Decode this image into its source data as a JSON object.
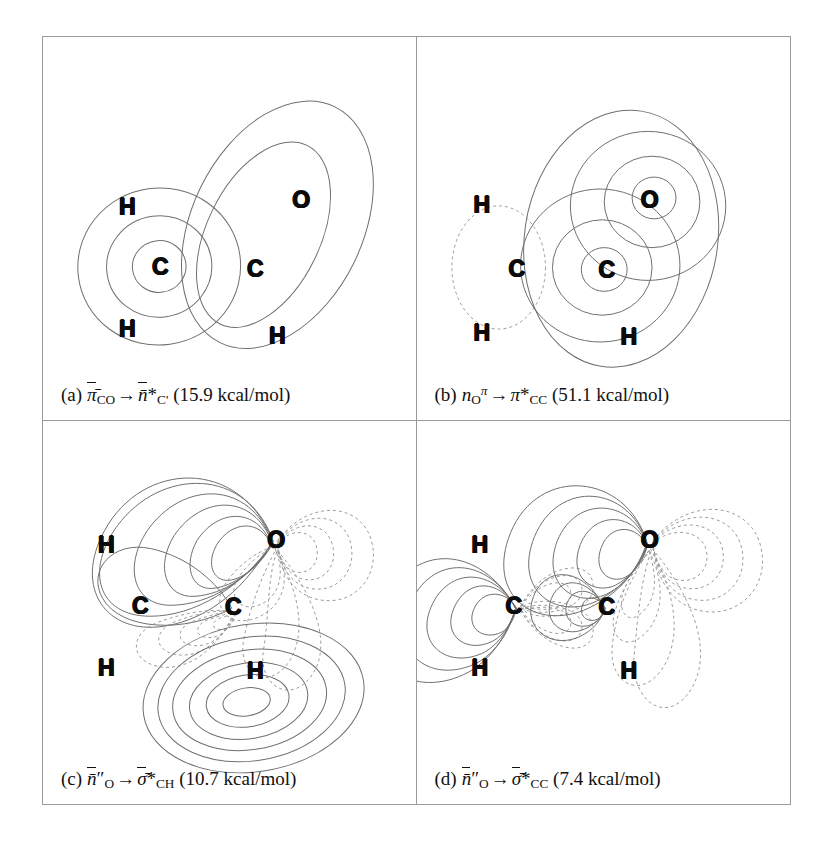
{
  "figure": {
    "kind": "molecular-orbital-contour-panels",
    "panel_count": 4,
    "molecule_atoms": [
      "H",
      "C",
      "H",
      "C",
      "O",
      "H"
    ]
  },
  "panels": [
    {
      "id": "a",
      "label": "(a)",
      "donor": {
        "symbol": "π",
        "overbar": true,
        "sub": "CO",
        "sup": "",
        "star": false
      },
      "acceptor": {
        "symbol": "n",
        "overbar": true,
        "sub": "C'",
        "sup": "",
        "star": true
      },
      "arrow": "→",
      "energy_value": "15.9",
      "energy_units": "kcal/mol",
      "energy_text": "(15.9 kcal/mol)",
      "caption_plain": "(a) π̄CO→n̄*C' (15.9 kcal/mol)",
      "atoms": [
        {
          "symbol": "H",
          "x": 84,
          "y": 170
        },
        {
          "symbol": "C",
          "x": 117,
          "y": 230
        },
        {
          "symbol": "H",
          "x": 84,
          "y": 292
        },
        {
          "symbol": "C",
          "x": 212,
          "y": 232
        },
        {
          "symbol": "O",
          "x": 258,
          "y": 163
        },
        {
          "symbol": "H",
          "x": 234,
          "y": 299
        }
      ]
    },
    {
      "id": "b",
      "label": "(b)",
      "donor": {
        "symbol": "n",
        "overbar": false,
        "sub": "O",
        "sup": "π",
        "star": false
      },
      "acceptor": {
        "symbol": "π",
        "overbar": false,
        "sub": "CC",
        "sup": "",
        "star": true
      },
      "arrow": "→",
      "energy_value": "51.1",
      "energy_units": "kcal/mol",
      "energy_text": "(51.1 kcal/mol)",
      "caption_plain": "(b) nOπ→π*CC (51.1 kcal/mol)",
      "atoms": [
        {
          "symbol": "H",
          "x": 65,
          "y": 168
        },
        {
          "symbol": "C",
          "x": 100,
          "y": 232
        },
        {
          "symbol": "H",
          "x": 65,
          "y": 296
        },
        {
          "symbol": "C",
          "x": 190,
          "y": 233
        },
        {
          "symbol": "O",
          "x": 233,
          "y": 163
        },
        {
          "symbol": "H",
          "x": 212,
          "y": 300
        }
      ]
    },
    {
      "id": "c",
      "label": "(c)",
      "donor": {
        "symbol": "n",
        "overbar": true,
        "sub": "O",
        "sup": "",
        "prime": "″",
        "star": false
      },
      "acceptor": {
        "symbol": "σ",
        "overbar": true,
        "sub": "CH",
        "sup": "",
        "star": true
      },
      "arrow": "→",
      "energy_value": "10.7",
      "energy_units": "kcal/mol",
      "energy_text": "(10.7 kcal/mol)",
      "caption_plain": "(c) n̄″O→σ̄*CH (10.7 kcal/mol)",
      "atoms": [
        {
          "symbol": "H",
          "x": 63,
          "y": 124
        },
        {
          "symbol": "C",
          "x": 97,
          "y": 185
        },
        {
          "symbol": "H",
          "x": 63,
          "y": 247
        },
        {
          "symbol": "C",
          "x": 190,
          "y": 186
        },
        {
          "symbol": "O",
          "x": 233,
          "y": 119
        },
        {
          "symbol": "H",
          "x": 212,
          "y": 250
        }
      ]
    },
    {
      "id": "d",
      "label": "(d)",
      "donor": {
        "symbol": "n",
        "overbar": true,
        "sub": "O",
        "sup": "",
        "prime": "″",
        "star": false
      },
      "acceptor": {
        "symbol": "σ",
        "overbar": true,
        "sub": "CC",
        "sup": "",
        "star": true
      },
      "arrow": "→",
      "energy_value": "7.4",
      "energy_units": "kcal/mol",
      "energy_text": "(7.4 kcal/mol)",
      "caption_plain": "(d) n̄″O→σ̄*CC (7.4 kcal/mol)",
      "atoms": [
        {
          "symbol": "H",
          "x": 63,
          "y": 124
        },
        {
          "symbol": "C",
          "x": 97,
          "y": 185
        },
        {
          "symbol": "H",
          "x": 63,
          "y": 247
        },
        {
          "symbol": "C",
          "x": 190,
          "y": 186
        },
        {
          "symbol": "O",
          "x": 233,
          "y": 119
        },
        {
          "symbol": "H",
          "x": 212,
          "y": 250
        }
      ]
    }
  ],
  "colors": {
    "background": "#ffffff",
    "frame": "#9a9a9a",
    "contour_positive": "#6f6f6f",
    "contour_negative": "#9b9b9b",
    "text": "#111111"
  }
}
